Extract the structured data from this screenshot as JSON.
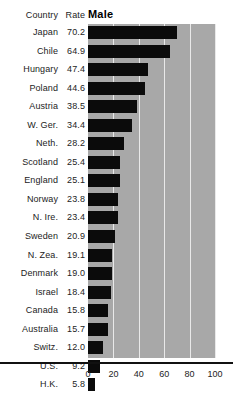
{
  "header": {
    "country_label": "Country",
    "rate_label": "Rate",
    "series_label": "Male"
  },
  "axis": {
    "ticks": [
      "0",
      "20",
      "40",
      "60",
      "80",
      "100"
    ]
  },
  "chart_data": {
    "type": "bar",
    "orientation": "horizontal",
    "title": "Male",
    "xlabel": "",
    "ylabel": "Country",
    "xlim": [
      0,
      100
    ],
    "grid": true,
    "legend": "none",
    "categories": [
      "Japan",
      "Chile",
      "Hungary",
      "Poland",
      "Austria",
      "W. Ger.",
      "Neth.",
      "Scotland",
      "England",
      "Norway",
      "N. Ire.",
      "Sweden",
      "N. Zea.",
      "Denmark",
      "Israel",
      "Canada",
      "Australia",
      "Switz.",
      "U.S.",
      "H.K."
    ],
    "values": [
      70.2,
      64.9,
      47.4,
      44.6,
      38.5,
      34.4,
      28.2,
      25.4,
      25.1,
      23.8,
      23.4,
      20.9,
      19.1,
      19.0,
      18.4,
      15.8,
      15.7,
      12.0,
      9.2,
      5.8
    ],
    "value_labels": [
      "70.2",
      "64.9",
      "47.4",
      "44.6",
      "38.5",
      "34.4",
      "28.2",
      "25.4",
      "25.1",
      "23.8",
      "23.4",
      "20.9",
      "19.1",
      "19.0",
      "18.4",
      "15.8",
      "15.7",
      "12.0",
      "9.2",
      "5.8"
    ],
    "xticks": [
      0,
      20,
      40,
      60,
      80,
      100
    ],
    "bar_color": "#0b0b0b",
    "plot_background": "#a8a8a8",
    "gridline_color": "#e9e9e9"
  }
}
